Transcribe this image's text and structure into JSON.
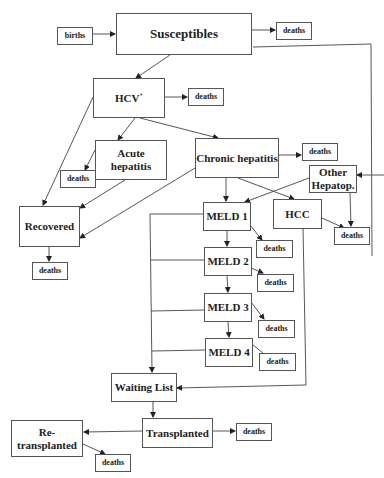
{
  "diagram": {
    "nodes": {
      "births": "births",
      "susceptibles": "Susceptibles",
      "deaths_susceptibles": "deaths",
      "hcv": "HCV",
      "hcv_sup": "+",
      "deaths_hcv": "deaths",
      "acute": "Acute hepatitis",
      "deaths_acute": "deaths",
      "chronic": "Chronic hepatitis",
      "deaths_chronic": "deaths",
      "other_hepatop": "Other Hepatop.",
      "recovered": "Recovered",
      "deaths_recovered": "deaths",
      "meld1": "MELD 1",
      "deaths_meld1": "deaths",
      "hcc": "HCC",
      "deaths_hcc": "deaths",
      "meld2": "MELD 2",
      "deaths_meld2": "deaths",
      "meld3": "MELD 3",
      "deaths_meld3": "deaths",
      "meld4": "MELD 4",
      "deaths_meld4": "deaths",
      "waiting_list": "Waiting List",
      "transplanted": "Transplanted",
      "deaths_transplanted": "deaths",
      "retransplanted": "Re-transplanted",
      "deaths_retransplanted": "deaths"
    },
    "edges": [
      [
        "births",
        "susceptibles"
      ],
      [
        "susceptibles",
        "deaths"
      ],
      [
        "susceptibles",
        "hcv"
      ],
      [
        "susceptibles",
        "other_hepatop"
      ],
      [
        "hcv",
        "deaths"
      ],
      [
        "hcv",
        "acute"
      ],
      [
        "hcv",
        "chronic"
      ],
      [
        "hcv",
        "recovered"
      ],
      [
        "acute",
        "deaths"
      ],
      [
        "acute",
        "recovered"
      ],
      [
        "chronic",
        "recovered"
      ],
      [
        "chronic",
        "deaths"
      ],
      [
        "chronic",
        "meld1"
      ],
      [
        "chronic",
        "hcc"
      ],
      [
        "other_hepatop",
        "meld1"
      ],
      [
        "other_hepatop",
        "deaths"
      ],
      [
        "hcc",
        "deaths"
      ],
      [
        "hcc",
        "waiting_list"
      ],
      [
        "recovered",
        "deaths"
      ],
      [
        "meld1",
        "meld2"
      ],
      [
        "meld1",
        "deaths"
      ],
      [
        "meld1",
        "waiting_list"
      ],
      [
        "meld2",
        "meld3"
      ],
      [
        "meld2",
        "deaths"
      ],
      [
        "meld2",
        "waiting_list"
      ],
      [
        "meld3",
        "meld4"
      ],
      [
        "meld3",
        "deaths"
      ],
      [
        "meld3",
        "waiting_list"
      ],
      [
        "meld4",
        "deaths"
      ],
      [
        "meld4",
        "waiting_list"
      ],
      [
        "waiting_list",
        "transplanted"
      ],
      [
        "transplanted",
        "deaths"
      ],
      [
        "transplanted",
        "retransplanted"
      ],
      [
        "retransplanted",
        "deaths"
      ]
    ]
  }
}
